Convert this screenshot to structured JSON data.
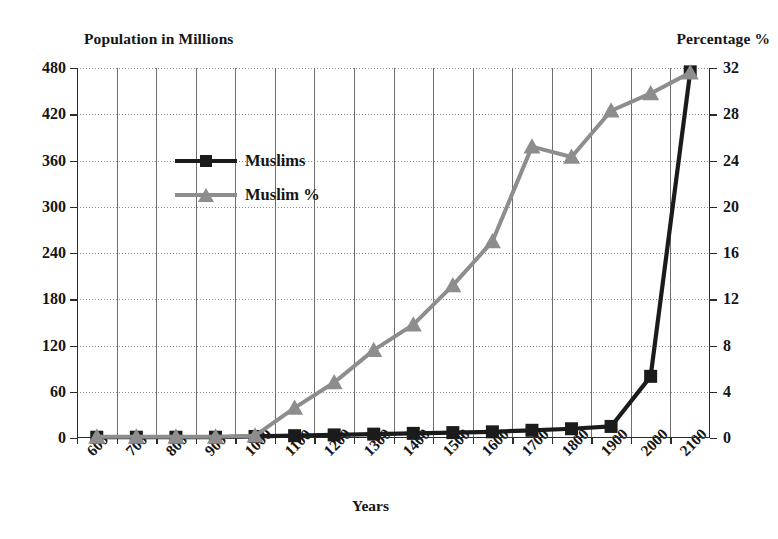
{
  "axis_captions": {
    "left": "Population in Millions",
    "right": "Percentage %"
  },
  "xaxis_title": "Years",
  "legend": {
    "items": [
      {
        "label": "Muslims",
        "color": "#1b1b1b",
        "marker": "square"
      },
      {
        "label": "Muslim %",
        "color": "#8d8d8d",
        "marker": "triangle"
      }
    ]
  },
  "chart_data": {
    "type": "line",
    "title": "",
    "xlabel": "Years",
    "ylabel": "Population in Millions",
    "y2label": "Percentage %",
    "grid": true,
    "legend_position": "top-left-inside",
    "categories": [
      "600",
      "700",
      "800",
      "900",
      "1000",
      "1100",
      "1200",
      "1300",
      "1400",
      "1500",
      "1600",
      "1700",
      "1800",
      "1900",
      "2000",
      "2100"
    ],
    "ylim": [
      0,
      480
    ],
    "yticks": [
      0,
      60,
      120,
      180,
      240,
      300,
      360,
      420,
      480
    ],
    "y2lim": [
      0,
      32
    ],
    "y2ticks": [
      0,
      4,
      8,
      12,
      16,
      20,
      24,
      28,
      32
    ],
    "series": [
      {
        "name": "Muslims",
        "axis": "left",
        "color": "#1b1b1b",
        "marker": "square",
        "values": [
          1,
          1,
          1,
          1,
          2,
          3,
          4,
          5,
          6,
          7,
          8,
          10,
          12,
          15,
          80,
          475
        ]
      },
      {
        "name": "Muslim %",
        "axis": "right",
        "color": "#8d8d8d",
        "marker": "triangle",
        "values": [
          0.1,
          0.1,
          0.1,
          0.1,
          0.2,
          2.6,
          4.8,
          7.6,
          9.8,
          13.2,
          17.0,
          25.2,
          24.3,
          28.3,
          29.8,
          31.6
        ]
      }
    ]
  }
}
